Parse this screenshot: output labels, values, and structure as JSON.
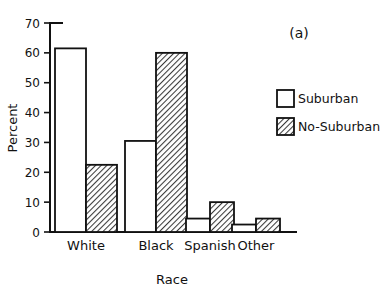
{
  "chart_data": {
    "type": "bar",
    "title": "",
    "panel_label": "(a)",
    "xlabel": "Race",
    "ylabel": "Percent",
    "categories": [
      "White",
      "Black",
      "Spanish",
      "Other"
    ],
    "series": [
      {
        "name": "Suburban",
        "values": [
          61.5,
          30.5,
          4.5,
          2.5
        ],
        "style": "open"
      },
      {
        "name": "No-Suburban",
        "values": [
          22.5,
          60.0,
          10.0,
          4.5
        ],
        "style": "hatched"
      }
    ],
    "ylim": [
      0,
      70
    ],
    "yticks": [
      0,
      10,
      20,
      30,
      40,
      50,
      60,
      70
    ],
    "ytick_labels": [
      "0",
      "10",
      "20",
      "30",
      "40",
      "50",
      "60",
      "70"
    ],
    "grid": false,
    "legend_position": "right"
  },
  "legend": {
    "items": [
      {
        "label": "Suburban",
        "swatch": "open-square-icon"
      },
      {
        "label": "No-Suburban",
        "swatch": "hatched-square-icon"
      }
    ]
  },
  "axes": {
    "y_title": "Percent",
    "x_title": "Race"
  },
  "annotations": {
    "panel": "(a)"
  }
}
